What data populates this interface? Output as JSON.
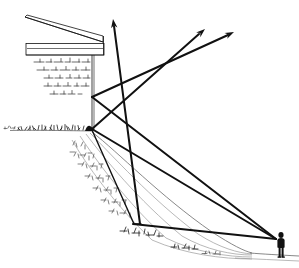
{
  "figure": {
    "type": "line-drawing",
    "medium": "pen-and-ink technical sketch",
    "background_color": "#ffffff",
    "ink_color": "#111111",
    "width": 299,
    "height": 268
  },
  "structure": {
    "name": "building-on-terrace",
    "roof": {
      "name": "sloping-roof",
      "points": "25,18 102,43 102,36 28,16"
    },
    "slab": {
      "name": "terrace-slab",
      "x": 26,
      "y": 43,
      "width": 78,
      "height": 12,
      "front_edge_y": 55
    },
    "slab_return": {
      "name": "slab-right-return",
      "points": "104,36 104,55"
    },
    "wall": {
      "name": "retaining-wall-face",
      "top": 55,
      "bottom": 131,
      "x": 92
    },
    "ground_platform": {
      "name": "upper-ground-line",
      "y": 130,
      "x_start": 8,
      "x_end": 92
    }
  },
  "wall_texture": {
    "name": "wall-hatching",
    "rows": [
      {
        "y": 62,
        "x1": 34,
        "x2": 90
      },
      {
        "y": 70,
        "x1": 38,
        "x2": 90
      },
      {
        "y": 78,
        "x1": 44,
        "x2": 90
      },
      {
        "y": 86,
        "x1": 44,
        "x2": 90
      },
      {
        "y": 94,
        "x1": 50,
        "x2": 82
      }
    ]
  },
  "rays": {
    "label": "sight-lines",
    "nodes": {
      "wall_upper": {
        "name": "upper-reflection-node",
        "x": 92,
        "y": 97
      },
      "wall_lower": {
        "name": "lower-reflection-node",
        "x": 92,
        "y": 129
      },
      "crossing_high": {
        "name": "ray-crossing-point",
        "x": 156,
        "y": 78
      },
      "slope_node": {
        "name": "mid-slope-node",
        "x": 133,
        "y": 223
      },
      "observer": {
        "name": "observer-eye-point",
        "x": 277,
        "y": 239
      }
    },
    "segments": [
      {
        "name": "ray-vertical-up",
        "from": "140,222",
        "to": "113,20",
        "arrow": true,
        "weight": "heavy"
      },
      {
        "name": "ray-upper-node-to-arrow-right",
        "from": "92,97",
        "to": "233,32",
        "arrow": true,
        "weight": "heavy"
      },
      {
        "name": "ray-lower-node-to-arrow-mid",
        "from": "92,129",
        "to": "203,30",
        "arrow": true,
        "weight": "heavy"
      },
      {
        "name": "ray-upper-node-to-observer",
        "from": "92,97",
        "to": "277,239",
        "arrow": false,
        "weight": "heavy"
      },
      {
        "name": "ray-lower-node-to-observer",
        "from": "92,129",
        "to": "277,239",
        "arrow": false,
        "weight": "heavy"
      },
      {
        "name": "ray-slope-node-to-observer",
        "from": "133,223",
        "to": "277,239",
        "arrow": false,
        "weight": "heavy"
      },
      {
        "name": "ray-lower-node-to-slope-node",
        "from": "92,129",
        "to": "133,223",
        "arrow": false,
        "weight": "medium"
      }
    ],
    "arrowheads": [
      {
        "name": "arrowhead-up",
        "x": 113,
        "y": 20,
        "angle": -82
      },
      {
        "name": "arrowhead-upper-right",
        "x": 233,
        "y": 32,
        "angle": -25
      },
      {
        "name": "arrowhead-mid-right",
        "x": 203,
        "y": 30,
        "angle": -42
      }
    ]
  },
  "terrain": {
    "name": "sloping-embankment",
    "crest": {
      "x": 92,
      "y": 131
    },
    "toe": {
      "x": 250,
      "y": 253
    },
    "ground_line_far": {
      "x1": 250,
      "y1": 253,
      "x2": 299,
      "y2": 256
    },
    "contour_count": 7,
    "description": "grassed bank falling from wall base to lower ground at right"
  },
  "figure_person": {
    "name": "standing-observer",
    "x": 281,
    "y": 232,
    "height_px": 26,
    "description": "small silhouette of a standing person giving human scale"
  },
  "annotations": {
    "has_text_labels": false,
    "note": "no lettering or numerals appear in the drawing"
  }
}
